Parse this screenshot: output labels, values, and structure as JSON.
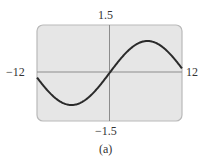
{
  "chart_data": {
    "type": "line",
    "title": "",
    "caption": "(a)",
    "xlabel": "",
    "ylabel": "",
    "xlim": [
      -12,
      12
    ],
    "ylim": [
      -1.5,
      1.5
    ],
    "tick_labels": {
      "x_min": "−12",
      "x_max": "12",
      "y_max": "1.5",
      "y_min": "−1.5"
    },
    "grid": false,
    "series": [
      {
        "name": "y = sin(x/4)",
        "function": "sin(x/4)",
        "x": [
          -12,
          -10,
          -8,
          -6.28,
          -4,
          -2,
          0,
          2,
          4,
          6.28,
          8,
          10,
          12
        ],
        "values": [
          -0.14,
          -0.6,
          -0.91,
          -1.0,
          -0.84,
          -0.48,
          0,
          0.48,
          0.84,
          1.0,
          0.91,
          0.6,
          0.14
        ]
      }
    ],
    "colors": {
      "plot_bg": "#e6e6e6",
      "frame": "#b9b9b9",
      "axis": "#8c8c8c",
      "curve": "#2a2a2a"
    }
  },
  "labels": {
    "y_top": "1.5",
    "y_bottom": "−1.5",
    "x_left": "−12",
    "x_right": "12",
    "caption": "(a)"
  }
}
